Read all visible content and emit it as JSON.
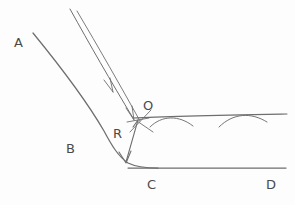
{
  "figure": {
    "kind": "hand-drawn-engineering-sketch",
    "background_color": "#fdfdfd",
    "ink_color": "#6e6e6e",
    "label_color": "#4a4a4a"
  },
  "labels": [
    {
      "id": "A",
      "text": "A",
      "x": 14,
      "y": 36,
      "role": "upper-left-segment-label"
    },
    {
      "id": "B",
      "text": "B",
      "x": 66,
      "y": 142,
      "role": "fillet-curve-label"
    },
    {
      "id": "O",
      "text": "O",
      "x": 143,
      "y": 99,
      "role": "vertex-point-label"
    },
    {
      "id": "R",
      "text": "R",
      "x": 113,
      "y": 127,
      "role": "radius-dimension-label"
    },
    {
      "id": "C",
      "text": "C",
      "x": 147,
      "y": 178,
      "role": "lower-left-segment-label"
    },
    {
      "id": "D",
      "text": "D",
      "x": 266,
      "y": 178,
      "role": "lower-right-segment-label"
    }
  ],
  "geometry": {
    "main_curve_path": "M 33 33 C 60 66, 86 100, 104 131 C 112 146, 118 156, 128 163 C 136 167, 146 168, 158 168",
    "bottom_line_path": "M 128 168 L 286 168",
    "inner_line_path": "M 70 9 C 90 45, 110 80, 133 118",
    "construction_line_path": "M 77 11 C 99 48, 120 85, 140 121",
    "horizontal_ref_line_path": "M 133 118 C 170 116, 230 115, 287 114",
    "arc_one_path": "M 150 126 C 162 116, 178 116, 192 125",
    "arc_two_path": "M 218 126 C 232 114, 250 113, 266 122",
    "radius_arrow_path": "M 138 120 L 126 162",
    "vertex_tick_horizontal": "M 128 121 L 148 119",
    "vertex_tick_diagonal": "M 131 131 L 150 111",
    "vertex_spur_path": "M 138 121 L 152 131",
    "arrow_mid_tip": {
      "x": 113,
      "y": 92
    },
    "arrow_lower_tip": {
      "x": 134,
      "y": 120
    },
    "radius_arrow_tip": {
      "x": 126,
      "y": 163
    },
    "radius_arrow_tail_tip": {
      "x": 138,
      "y": 120
    }
  }
}
